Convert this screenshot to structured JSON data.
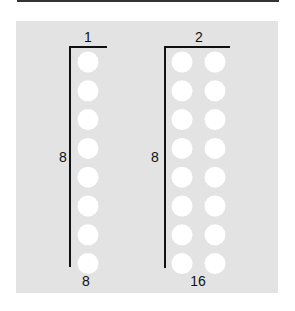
{
  "diagram": {
    "groups": [
      {
        "top_label": "1",
        "side_label": "8",
        "bottom_label": "8",
        "columns": 1,
        "rows": 8
      },
      {
        "top_label": "2",
        "side_label": "8",
        "bottom_label": "16",
        "columns": 2,
        "rows": 8
      }
    ],
    "colors": {
      "background": "#e3e3e3",
      "dot": "#ffffff",
      "line": "#111111"
    }
  }
}
